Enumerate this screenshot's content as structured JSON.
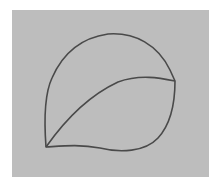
{
  "image": {
    "description": "Pencil sketch of a leaf-like closed shape divided by an inner curve, on gray paper",
    "colors": {
      "background": "#ffffff",
      "paper": "#bdbdbd",
      "stroke": "#4a4a4a"
    }
  }
}
